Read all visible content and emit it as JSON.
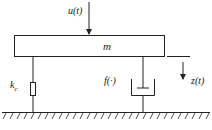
{
  "diagram": {
    "type": "mass-spring-damper",
    "labels": {
      "input": "u(t)",
      "mass": "m",
      "stiffness_main": "k",
      "stiffness_sub": "c",
      "damper": "f(·)",
      "displacement": "z(t)"
    },
    "colors": {
      "line": "#222222",
      "background": "#ffffff"
    }
  }
}
